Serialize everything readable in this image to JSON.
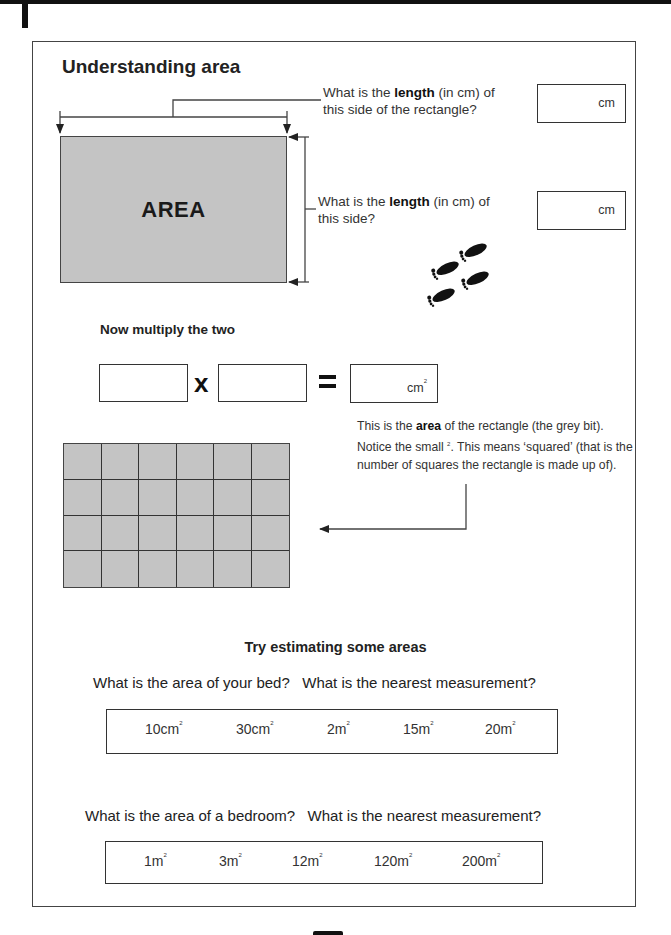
{
  "page": {
    "title": "Understanding area",
    "section1": {
      "question_top": {
        "prefix": "What is the ",
        "bold": "length",
        "suffix_line1": " (in cm) of",
        "line2": "this side of the rectangle?",
        "unit": "cm"
      },
      "question_side": {
        "prefix": "What is the ",
        "bold": "length",
        "suffix_line1": " (in cm) of",
        "line2": "this side?",
        "unit": "cm"
      },
      "rectangle_label": "AREA",
      "footprints_icon": "footprints-icon"
    },
    "multiply": {
      "heading": "Now multiply the two",
      "times_symbol": "x",
      "equals_symbol": "=",
      "result_unit": "cm",
      "result_exponent": "2"
    },
    "note": {
      "part1": "This is the ",
      "bold": "area",
      "part2": " of the rectangle (the grey bit).",
      "part3": "Notice the small ",
      "exponent": "2",
      "part4": ". This means ‘squared’ (that is the number of squares the rectangle is made up of)."
    },
    "grid": {
      "rows": 4,
      "cols": 6
    },
    "estimating": {
      "heading": "Try estimating some areas",
      "questions": [
        {
          "text": "What is the area of your bed?   What is the nearest measurement?",
          "options": [
            {
              "value": "10cm",
              "exp": "2"
            },
            {
              "value": "30cm",
              "exp": "2"
            },
            {
              "value": "2m",
              "exp": "2"
            },
            {
              "value": "15m",
              "exp": "2"
            },
            {
              "value": "20m",
              "exp": "2"
            }
          ]
        },
        {
          "text": "What is the area of a bedroom?   What is the nearest measurement?",
          "options": [
            {
              "value": "1m",
              "exp": "2"
            },
            {
              "value": "3m",
              "exp": "2"
            },
            {
              "value": "12m",
              "exp": "2"
            },
            {
              "value": "120m",
              "exp": "2"
            },
            {
              "value": "200m",
              "exp": "2"
            }
          ]
        }
      ]
    }
  }
}
